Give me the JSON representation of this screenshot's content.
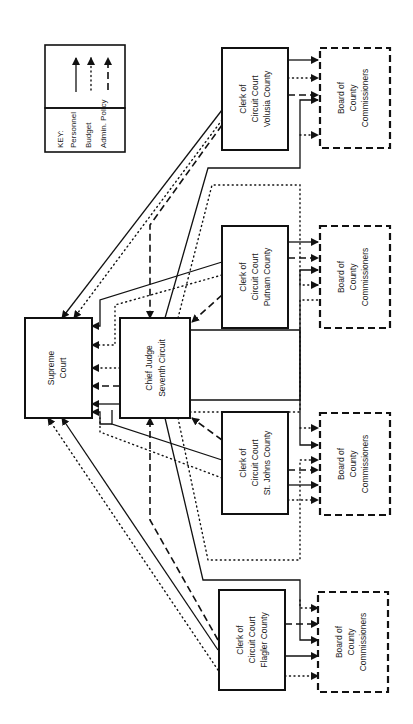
{
  "key": {
    "title": "KEY:",
    "items": [
      {
        "label": "Personnel",
        "style": "solid"
      },
      {
        "label": "Budget",
        "style": "dotted"
      },
      {
        "label": "Admin. Policy",
        "style": "dashed"
      }
    ]
  },
  "nodes": {
    "supreme_court": {
      "line1": "Supreme",
      "line2": "Court"
    },
    "chief_judge": {
      "line1": "Chief Judge",
      "line2": "Seventh Circuit"
    },
    "clerks": [
      {
        "line1": "Clerk of",
        "line2": "Circuit Court",
        "line3": "Volusia County"
      },
      {
        "line1": "Clerk of",
        "line2": "Circuit Court",
        "line3": "Putnam County"
      },
      {
        "line1": "Clerk of",
        "line2": "Circuit Court",
        "line3": "St. Johns County"
      },
      {
        "line1": "Clerk of",
        "line2": "Circuit Court",
        "line3": "Flagler County"
      }
    ],
    "boards": [
      {
        "line1": "Board of",
        "line2": "County",
        "line3": "Commissioners"
      },
      {
        "line1": "Board of",
        "line2": "County",
        "line3": "Commissioners"
      },
      {
        "line1": "Board of",
        "line2": "County",
        "line3": "Commissioners"
      },
      {
        "line1": "Board of",
        "line2": "County",
        "line3": "Commissioners"
      }
    ]
  },
  "colors": {
    "ink": "#111111",
    "background": "#ffffff"
  }
}
